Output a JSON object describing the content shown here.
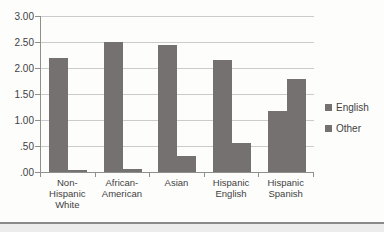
{
  "chart_data": {
    "type": "bar",
    "title": "",
    "xlabel": "",
    "ylabel": "",
    "categories": [
      "Non-\nHispanic\nWhite",
      "African-\nAmerican",
      "Asian",
      "Hispanic\nEnglish",
      "Hispanic\nSpanish"
    ],
    "series": [
      {
        "name": "English",
        "color": "#757171",
        "values": [
          2.2,
          2.5,
          2.45,
          2.15,
          1.18
        ]
      },
      {
        "name": "Other",
        "color": "#757171",
        "values": [
          0.03,
          0.06,
          0.3,
          0.55,
          1.78
        ]
      }
    ],
    "ylim": [
      0,
      3.0
    ],
    "yticks": [
      {
        "label": "3.00",
        "value": 3.0
      },
      {
        "label": "2.50",
        "value": 2.5
      },
      {
        "label": "2.00",
        "value": 2.0
      },
      {
        "label": "1.50",
        "value": 1.5
      },
      {
        "label": "1.00",
        "value": 1.0
      },
      {
        "label": ".50",
        "value": 0.5
      },
      {
        "label": ".00",
        "value": 0.0
      }
    ],
    "grid": true,
    "legend_position": "right"
  }
}
